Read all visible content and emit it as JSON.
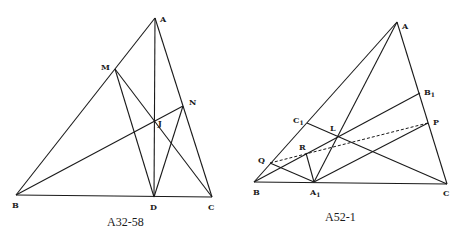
{
  "figures": [
    {
      "caption": "A32-58",
      "labels": {
        "A": "A",
        "M": "M",
        "N": "N",
        "J": "J",
        "B": "B",
        "D": "D",
        "C": "C"
      }
    },
    {
      "caption": "A52-1",
      "labels": {
        "A": "A",
        "B1": "B",
        "B1_sub": "1",
        "P": "P",
        "C1": "C",
        "C1_sub": "1",
        "L": "L",
        "R": "R",
        "Q": "Q",
        "B": "B",
        "A1": "A",
        "A1_sub": "1",
        "C": "C"
      }
    }
  ]
}
